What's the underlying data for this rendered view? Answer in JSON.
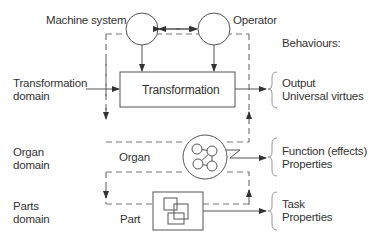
{
  "diagram": {
    "nodes": {
      "machine_system": "Machine system",
      "operator": "Operator",
      "transformation": "Transformation",
      "organ": "Organ",
      "part": "Part"
    },
    "domains": {
      "transformation": [
        "Transformation",
        "domain"
      ],
      "organ": [
        "Organ",
        "domain"
      ],
      "parts": [
        "Parts",
        "domain"
      ]
    },
    "behaviours": {
      "heading": "Behaviours:",
      "output": [
        "Output",
        "Universal virtues"
      ],
      "function": [
        "Function (effects)",
        "Properties"
      ],
      "task": [
        "Task",
        "Properties"
      ]
    },
    "colors": {
      "line": "#555555",
      "dashed": "#777777",
      "text": "#333333"
    }
  }
}
